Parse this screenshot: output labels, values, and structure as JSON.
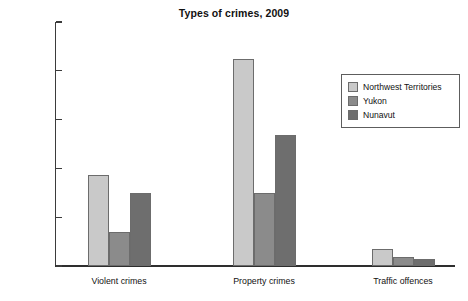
{
  "chart_data": {
    "type": "bar",
    "title": "Types of crimes, 2009",
    "xlabel": "",
    "ylabel": "",
    "ylim": [
      0,
      10000
    ],
    "grid": false,
    "legend_position": "upper-right-inside",
    "categories": [
      "Violent crimes",
      "Property crimes",
      "Traffic offences"
    ],
    "ytick_labels": [
      "10 000",
      "8 000",
      "6 000",
      "4 000",
      "2 000",
      "0"
    ],
    "ytick_values": [
      10000,
      8000,
      6000,
      4000,
      2000,
      0
    ],
    "series": [
      {
        "name": "Northwest Territories",
        "color": "#c9c9c9",
        "values": [
          3750,
          8500,
          700
        ]
      },
      {
        "name": "Yukon",
        "color": "#8b8b8b",
        "values": [
          1380,
          3000,
          350
        ]
      },
      {
        "name": "Nunavut",
        "color": "#6e6e6e",
        "values": [
          3000,
          5350,
          280
        ]
      }
    ]
  },
  "colors": {
    "background": "#ffffff",
    "axis": "#2e2e2e",
    "text": "#111111",
    "bar_outline": "#6c6c6c",
    "legend_border": "#5d5d5d"
  }
}
